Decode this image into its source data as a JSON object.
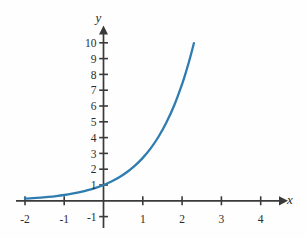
{
  "figure": {
    "background_color": "#fefefe",
    "axis_color": "#3a3a3a",
    "curve_color": "#2e7cb0",
    "text_color": "#2b2b2b"
  },
  "chart_data": {
    "type": "line",
    "title": "",
    "subtitle": "",
    "xlabel": "x",
    "ylabel": "y",
    "grid": false,
    "legend": null,
    "xlim": [
      -2.2,
      4.6
    ],
    "ylim": [
      -1.6,
      10.8
    ],
    "xticks": [
      -2,
      -1,
      1,
      2,
      3,
      4
    ],
    "yticks": [
      -1,
      1,
      2,
      3,
      4,
      5,
      6,
      7,
      8,
      9,
      10
    ],
    "xtick_labels": [
      "-2",
      "-1",
      "1",
      "2",
      "3",
      "4"
    ],
    "ytick_labels": [
      "-1",
      "1",
      "2",
      "3",
      "4",
      "5",
      "6",
      "7",
      "8",
      "9",
      "10"
    ],
    "series": [
      {
        "name": "exponential",
        "equation": "y = e^x",
        "x": [
          -2.0,
          -1.8,
          -1.6,
          -1.4,
          -1.2,
          -1.0,
          -0.8,
          -0.6,
          -0.4,
          -0.2,
          0.0,
          0.2,
          0.4,
          0.6,
          0.8,
          1.0,
          1.2,
          1.4,
          1.6,
          1.8,
          2.0,
          2.1,
          2.2,
          2.3
        ],
        "y": [
          0.135,
          0.165,
          0.202,
          0.247,
          0.301,
          0.368,
          0.449,
          0.549,
          0.67,
          0.819,
          1.0,
          1.221,
          1.492,
          1.822,
          2.226,
          2.718,
          3.32,
          4.055,
          4.953,
          6.05,
          7.389,
          8.166,
          9.025,
          9.974
        ]
      }
    ],
    "annotations": []
  },
  "labels": {
    "x_axis_name": "x",
    "y_axis_name": "y"
  }
}
